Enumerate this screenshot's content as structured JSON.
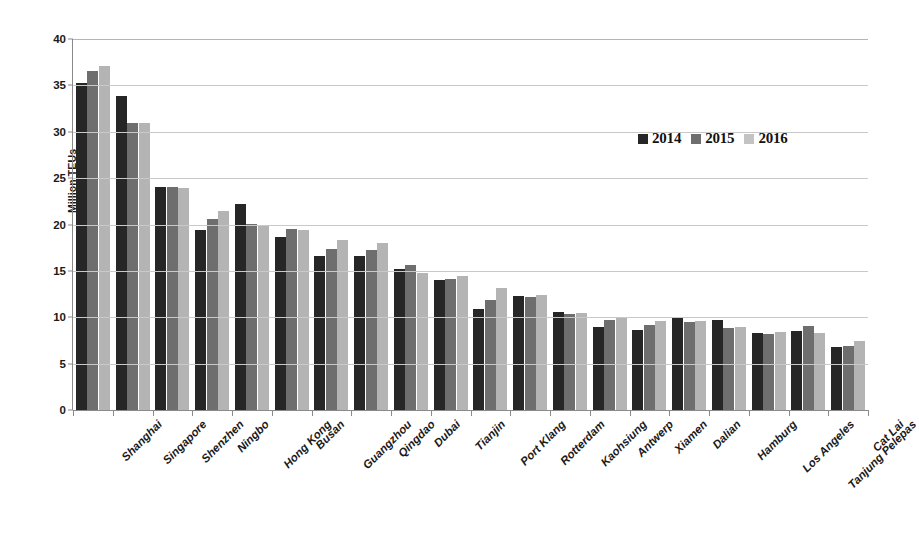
{
  "chart_data": {
    "type": "bar",
    "title": "",
    "subtitle": "",
    "xlabel": "",
    "ylabel": "Million TEUs",
    "ylim": [
      0,
      40
    ],
    "yticks": [
      0,
      5,
      10,
      15,
      20,
      25,
      30,
      35,
      40
    ],
    "grid": true,
    "legend_position": "top-right",
    "categories": [
      "Shanghai",
      "Singapore",
      "Shenzhen",
      "Ningbo",
      "Hong Kong",
      "Busan",
      "Guangzhou",
      "Qingdao",
      "Dubai",
      "Tianjin",
      "Port Klang",
      "Rotterdam",
      "Kaohsiung",
      "Antwerp",
      "Xiamen",
      "Dalian",
      "Hamburg",
      "Los Angeles",
      "Tanjung Pelepas",
      "Cat Lai"
    ],
    "series": [
      {
        "name": "2014",
        "color": "#262626",
        "values": [
          35.3,
          33.9,
          24.0,
          19.4,
          22.2,
          18.7,
          16.6,
          16.6,
          15.2,
          14.0,
          10.9,
          12.3,
          10.6,
          9.0,
          8.6,
          10.0,
          9.7,
          8.3,
          8.5,
          6.8
        ]
      },
      {
        "name": "2015",
        "color": "#6e6e6e",
        "values": [
          36.5,
          30.9,
          24.0,
          20.6,
          20.1,
          19.5,
          17.4,
          17.3,
          15.6,
          14.1,
          11.9,
          12.2,
          10.3,
          9.7,
          9.2,
          9.5,
          8.8,
          8.2,
          9.1,
          6.9
        ]
      },
      {
        "name": "2016",
        "color": "#b4b4b4",
        "values": [
          37.1,
          30.9,
          23.9,
          21.5,
          19.8,
          19.4,
          18.3,
          18.0,
          14.8,
          14.5,
          13.2,
          12.4,
          10.5,
          10.0,
          9.6,
          9.6,
          8.9,
          8.4,
          8.3,
          7.4
        ]
      }
    ]
  },
  "legend": {
    "items": [
      {
        "label": "2014"
      },
      {
        "label": "2015"
      },
      {
        "label": "2016"
      }
    ]
  },
  "axis": {
    "y_title": "Million TEUs"
  }
}
